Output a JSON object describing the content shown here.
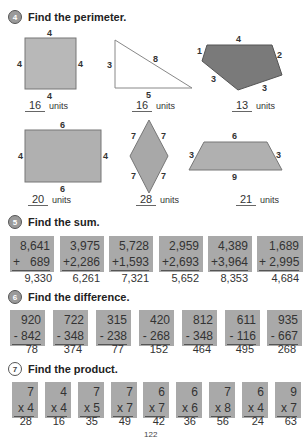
{
  "sections": {
    "perimeter": {
      "number": "4",
      "title": "Find the perimeter.",
      "unit_label": "units",
      "shapes": [
        {
          "type": "square",
          "labels": [
            "4",
            "4",
            "4",
            "4"
          ],
          "answer": "16"
        },
        {
          "type": "right-triangle",
          "labels": [
            "3",
            "8",
            "5"
          ],
          "answer": "16"
        },
        {
          "type": "pentagon",
          "labels": [
            "1",
            "4",
            "2",
            "3",
            "3"
          ],
          "answer": "13"
        },
        {
          "type": "rectangle",
          "labels": [
            "6",
            "4",
            "4",
            "6"
          ],
          "answer": "20"
        },
        {
          "type": "rhombus",
          "labels": [
            "7",
            "7",
            "7",
            "7"
          ],
          "answer": "28"
        },
        {
          "type": "trapezoid",
          "labels": [
            "6",
            "3",
            "3",
            "9"
          ],
          "answer": "21"
        }
      ]
    },
    "sum": {
      "number": "5",
      "title": "Find the sum.",
      "problems": [
        {
          "top": "8,641",
          "bottom": "+   689",
          "answer": "9,330"
        },
        {
          "top": "3,975",
          "bottom": "+2,286",
          "answer": "6,261"
        },
        {
          "top": "5,728",
          "bottom": "+1,593",
          "answer": "7,321"
        },
        {
          "top": "2,959",
          "bottom": "+2,693",
          "answer": "5,652"
        },
        {
          "top": "4,389",
          "bottom": "+3,964",
          "answer": "8,353"
        },
        {
          "top": "1,689",
          "bottom": "+ 2,995",
          "answer": "4,684"
        }
      ]
    },
    "difference": {
      "number": "6",
      "title": "Find the difference.",
      "problems": [
        {
          "top": "920",
          "bottom": "- 842",
          "answer": "78"
        },
        {
          "top": "722",
          "bottom": "- 348",
          "answer": "374"
        },
        {
          "top": "315",
          "bottom": "- 238",
          "answer": "77"
        },
        {
          "top": "420",
          "bottom": "- 268",
          "answer": "152"
        },
        {
          "top": "812",
          "bottom": "- 348",
          "answer": "464"
        },
        {
          "top": "611",
          "bottom": "- 116",
          "answer": "495"
        },
        {
          "top": "935",
          "bottom": "- 667",
          "answer": "268"
        }
      ]
    },
    "product": {
      "number": "7",
      "title": "Find the product.",
      "problems": [
        {
          "top": "7",
          "bottom": "x 4",
          "answer": "28"
        },
        {
          "top": "4",
          "bottom": "x 4",
          "answer": "16"
        },
        {
          "top": "7",
          "bottom": "x 5",
          "answer": "35"
        },
        {
          "top": "7",
          "bottom": "x 7",
          "answer": "49"
        },
        {
          "top": "6",
          "bottom": "x 7",
          "answer": "42"
        },
        {
          "top": "6",
          "bottom": "x 6",
          "answer": "36"
        },
        {
          "top": "7",
          "bottom": "x 8",
          "answer": "56"
        },
        {
          "top": "6",
          "bottom": "x 4",
          "answer": "24"
        },
        {
          "top": "9",
          "bottom": "x 7",
          "answer": "63"
        }
      ]
    }
  },
  "page_number": "122",
  "colors": {
    "shape_fill": "#b0b0b0",
    "pentagon_fill": "#7a7a7a",
    "box_fill": "#a9a9a9"
  }
}
